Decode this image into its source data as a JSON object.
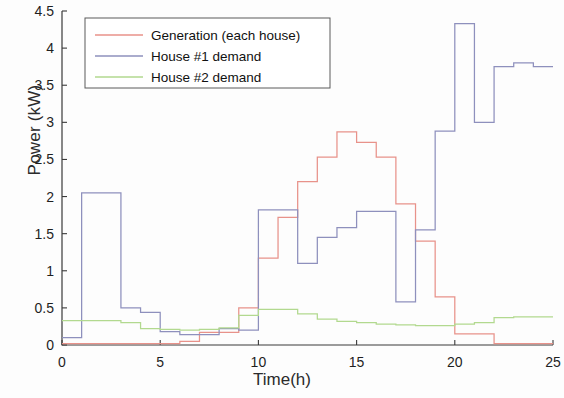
{
  "chart_data": {
    "type": "line",
    "title": "",
    "xlabel": "Time(h)",
    "ylabel": "Power (kW)",
    "xlim": [
      0,
      25
    ],
    "ylim": [
      0,
      4.5
    ],
    "xticks": [
      0,
      5,
      10,
      15,
      20,
      25
    ],
    "yticks": [
      0,
      0.5,
      1,
      1.5,
      2,
      2.5,
      3,
      3.5,
      4,
      4.5
    ],
    "xtick_labels": [
      "0",
      "5",
      "10",
      "15",
      "20",
      "25"
    ],
    "ytick_labels": [
      "0",
      "0.5",
      "1",
      "1.5",
      "2",
      "2.5",
      "3",
      "3.5",
      "4",
      "4.5"
    ],
    "grid": false,
    "drawstyle": "steps-post",
    "legend_position": "upper left",
    "series": [
      {
        "name": "Generation (each house)",
        "color": "#e8928a",
        "x": [
          0,
          1,
          2,
          3,
          4,
          5,
          6,
          7,
          8,
          9,
          10,
          11,
          12,
          13,
          14,
          15,
          16,
          17,
          18,
          19,
          20,
          21,
          22,
          23,
          24
        ],
        "values": [
          0.02,
          0.02,
          0.02,
          0.02,
          0.02,
          0.02,
          0.05,
          0.17,
          0.17,
          0.5,
          1.17,
          1.72,
          2.2,
          2.53,
          2.87,
          2.73,
          2.53,
          1.9,
          1.4,
          0.65,
          0.15,
          0.15,
          0.02,
          0.02,
          0.02
        ]
      },
      {
        "name": "House #1 demand",
        "color": "#8e90bd",
        "x": [
          0,
          1,
          2,
          3,
          4,
          5,
          6,
          7,
          8,
          9,
          10,
          11,
          12,
          13,
          14,
          15,
          16,
          17,
          18,
          19,
          20,
          21,
          22,
          23,
          24
        ],
        "values": [
          0.1,
          2.05,
          2.05,
          0.5,
          0.44,
          0.18,
          0.14,
          0.14,
          0.22,
          0.2,
          1.82,
          1.82,
          1.1,
          1.45,
          1.58,
          1.8,
          1.8,
          0.58,
          1.55,
          2.88,
          4.33,
          3.0,
          3.75,
          3.8,
          3.75
        ]
      },
      {
        "name": "House #2 demand",
        "color": "#b2d98f",
        "x": [
          0,
          1,
          2,
          3,
          4,
          5,
          6,
          7,
          8,
          9,
          10,
          11,
          12,
          13,
          14,
          15,
          16,
          17,
          18,
          19,
          20,
          21,
          22,
          23,
          24
        ],
        "values": [
          0.33,
          0.33,
          0.33,
          0.3,
          0.22,
          0.21,
          0.2,
          0.21,
          0.23,
          0.4,
          0.48,
          0.48,
          0.42,
          0.35,
          0.32,
          0.3,
          0.28,
          0.27,
          0.26,
          0.26,
          0.28,
          0.3,
          0.37,
          0.38,
          0.38
        ]
      }
    ]
  },
  "legend": {
    "entries": [
      {
        "label": "Generation (each house)"
      },
      {
        "label": "House #1 demand"
      },
      {
        "label": "House #2 demand"
      }
    ]
  }
}
